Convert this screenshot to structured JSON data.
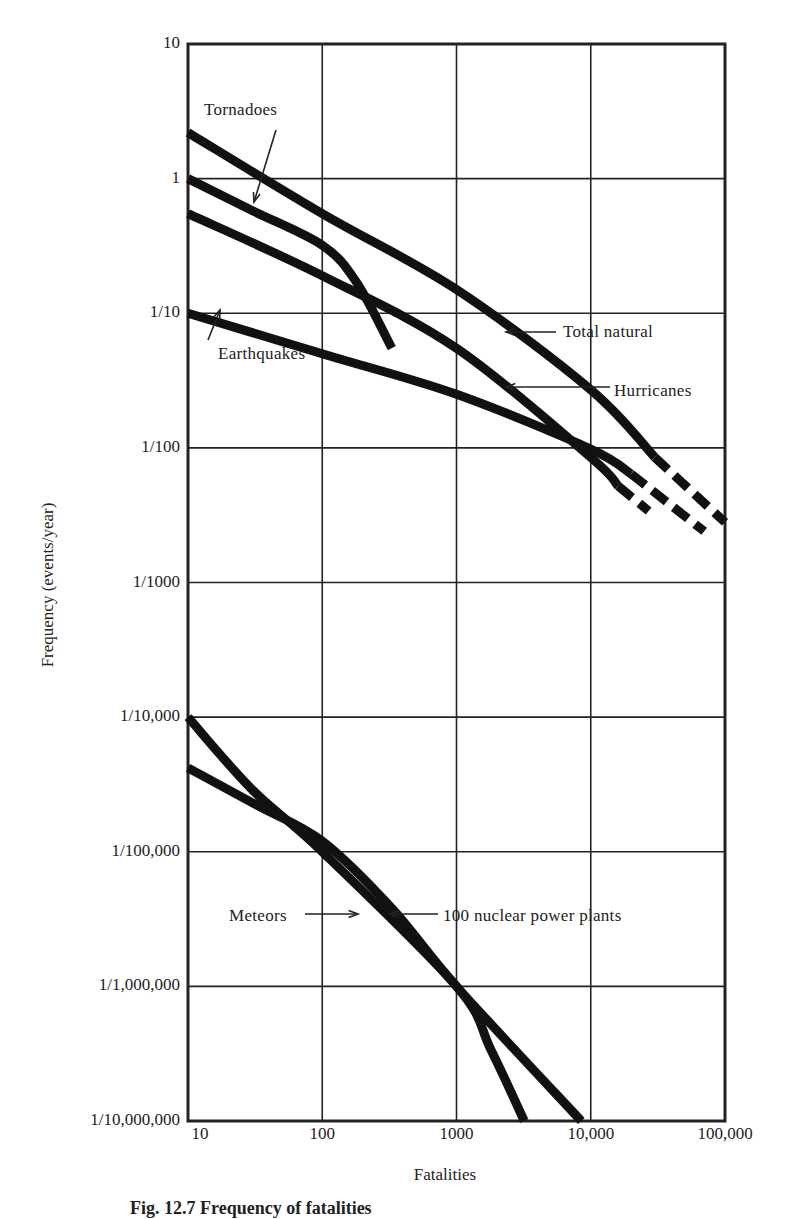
{
  "chart_data": {
    "type": "line",
    "title": "",
    "xlabel": "Fatalities",
    "ylabel": "Frequency (events/year)",
    "xscale": "log",
    "yscale": "log",
    "xlim": [
      10,
      100000
    ],
    "ylim": [
      1e-07,
      10
    ],
    "grid": true,
    "x_tick_labels": [
      "10",
      "100",
      "1000",
      "10,000",
      "100,000"
    ],
    "y_tick_labels": [
      "10",
      "1",
      "1/10",
      "1/100",
      "1/1000",
      "1/10,000",
      "1/100,000",
      "1/1,000,000",
      "1/10,000,000"
    ],
    "series": [
      {
        "name": "Total natural",
        "x": [
          10,
          100,
          1000,
          10000,
          30000,
          100000
        ],
        "y": [
          2.2,
          0.55,
          0.15,
          0.027,
          0.0085,
          0.0028
        ],
        "dashed_from_x": 30000
      },
      {
        "name": "Tornadoes",
        "x": [
          10,
          30,
          100,
          180,
          330,
          550
        ],
        "y": [
          1.0,
          0.58,
          0.32,
          0.17,
          0.055,
          0.022
        ],
        "dashed_from_x": 380
      },
      {
        "name": "Hurricanes",
        "x": [
          10,
          100,
          1000,
          10000,
          16000,
          27000
        ],
        "y": [
          0.55,
          0.19,
          0.055,
          0.0085,
          0.0052,
          0.0034
        ],
        "dashed_from_x": 16000
      },
      {
        "name": "Earthquakes",
        "x": [
          10,
          100,
          1000,
          10000,
          20000,
          70000
        ],
        "y": [
          0.1,
          0.05,
          0.025,
          0.0098,
          0.0064,
          0.0024
        ],
        "dashed_from_x": 20000
      },
      {
        "name": "100 nuclear power plants",
        "x": [
          10,
          30,
          100,
          1000,
          1800,
          3200
        ],
        "y": [
          0.0001,
          2.9e-05,
          1e-05,
          1e-06,
          3.4e-07,
          1e-07
        ]
      },
      {
        "name": "Meteors",
        "x": [
          10,
          33,
          100,
          330,
          1000,
          8500
        ],
        "y": [
          4.2e-05,
          2.2e-05,
          1.2e-05,
          3.8e-06,
          1e-06,
          1e-07
        ]
      }
    ]
  },
  "labels": {
    "tornadoes": "Tornadoes",
    "earthquakes": "Earthquakes",
    "total_natural": "Total natural",
    "hurricanes": "Hurricanes",
    "meteors": "Meteors",
    "nuclear": "100 nuclear power plants"
  },
  "caption": "Fig. 12.7   Frequency of fatalities"
}
